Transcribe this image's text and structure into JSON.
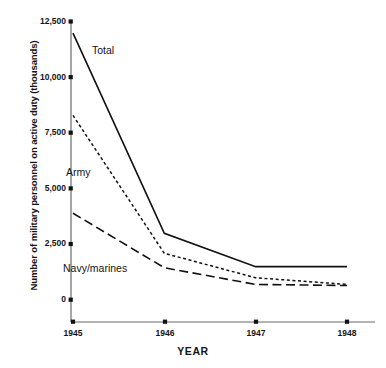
{
  "chart_data": {
    "type": "line",
    "title": "",
    "xlabel": "YEAR",
    "ylabel": "Number of military personnel on active duty (thousands)",
    "categories": [
      "1945",
      "1946",
      "1947",
      "1948"
    ],
    "x": [
      1945,
      1946,
      1947,
      1948
    ],
    "xlim": [
      1945,
      1948
    ],
    "ylim": [
      0,
      12500
    ],
    "yticks": [
      "0",
      "2,500",
      "5,000",
      "7,500",
      "10,000",
      "12,500"
    ],
    "ytick_values": [
      0,
      2500,
      5000,
      7500,
      10000,
      12500
    ],
    "xticks": [
      "1945",
      "1946",
      "1947",
      "1948"
    ],
    "grid": false,
    "legend_position": "inline-annotations",
    "series": [
      {
        "name": "Total",
        "style": "solid",
        "color": "#111111",
        "values": [
          12000,
          3000,
          1500,
          1500
        ]
      },
      {
        "name": "Army",
        "style": "dotted",
        "color": "#111111",
        "values": [
          8300,
          2100,
          1000,
          700
        ]
      },
      {
        "name": "Navy/marines",
        "style": "dashed",
        "color": "#111111",
        "values": [
          3900,
          1450,
          700,
          650
        ]
      }
    ],
    "annotations": [
      {
        "text": "Total",
        "series": "Total"
      },
      {
        "text": "Army",
        "series": "Army"
      },
      {
        "text": "Navy/marines",
        "series": "Navy/marines"
      }
    ]
  },
  "axis": {
    "color": "#6b6b6b",
    "tick_marker_color": "#111111"
  }
}
